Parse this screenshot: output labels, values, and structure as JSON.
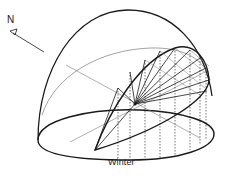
{
  "figure": {
    "caption": "Winter",
    "north_label": "N"
  },
  "colors": {
    "stroke": "#1a1a1a",
    "thin_stroke": "#7a7a7a",
    "background": "#ffffff"
  }
}
